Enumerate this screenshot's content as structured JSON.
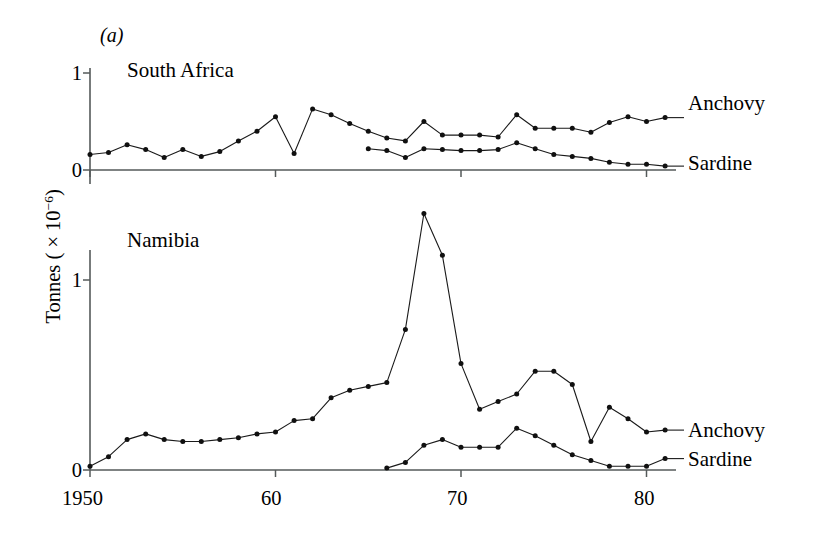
{
  "figure": {
    "panel_letter": "(a)",
    "y_axis_title_prefix": "Tonnes ( × 10",
    "y_axis_title_exponent": "−6",
    "y_axis_title_suffix": ")",
    "y_axis_title_full": "Tonnes ( × 10−6)"
  },
  "panels": [
    {
      "name": "south-africa",
      "title": "South Africa",
      "y_ticks": [
        "1",
        "0"
      ],
      "series_labels": [
        "Anchovy",
        "Sardine"
      ]
    },
    {
      "name": "namibia",
      "title": "Namibia",
      "y_ticks": [
        "1",
        "0"
      ],
      "series_labels": [
        "Anchovy",
        "Sardine"
      ]
    }
  ],
  "x_axis": {
    "tick_labels": [
      "1950",
      "60",
      "70",
      "80"
    ],
    "tick_values": [
      1950,
      1960,
      1970,
      1980
    ],
    "range": [
      1950,
      1981.5
    ]
  },
  "chart_data": [
    {
      "type": "line",
      "title": "South Africa",
      "panel": "upper",
      "xlabel": "",
      "ylabel": "Tonnes ( × 10−6)",
      "xlim": [
        1950,
        1981.5
      ],
      "ylim": [
        0,
        1.05
      ],
      "ytick_values": [
        0,
        1
      ],
      "ytick_labels": [
        "0",
        "1"
      ],
      "xtick_values": [
        1950,
        1960,
        1970,
        1980
      ],
      "xtick_labels": [
        "1950",
        "60",
        "70",
        "80"
      ],
      "grid": false,
      "legend": "right-of-plot",
      "markers": true,
      "series": [
        {
          "name": "Anchovy",
          "x": [
            1950,
            1951,
            1952,
            1953,
            1954,
            1955,
            1956,
            1957,
            1958,
            1959,
            1960,
            1961,
            1962,
            1963,
            1964,
            1965,
            1966,
            1967,
            1968,
            1969,
            1970,
            1971,
            1972,
            1973,
            1974,
            1975,
            1976,
            1977,
            1978,
            1979,
            1980,
            1981
          ],
          "values": [
            0.16,
            0.18,
            0.26,
            0.21,
            0.13,
            0.21,
            0.14,
            0.19,
            0.3,
            0.4,
            0.55,
            0.17,
            0.63,
            0.57,
            0.48,
            0.4,
            0.33,
            0.3,
            0.5,
            0.36,
            0.36,
            0.36,
            0.34,
            0.57,
            0.43,
            0.43,
            0.43,
            0.39,
            0.49,
            0.55,
            0.5,
            0.54
          ]
        },
        {
          "name": "Sardine",
          "x": [
            1965,
            1966,
            1967,
            1968,
            1969,
            1970,
            1971,
            1972,
            1973,
            1974,
            1975,
            1976,
            1977,
            1978,
            1979,
            1980,
            1981
          ],
          "values": [
            0.22,
            0.2,
            0.13,
            0.22,
            0.21,
            0.2,
            0.2,
            0.21,
            0.28,
            0.22,
            0.16,
            0.14,
            0.12,
            0.08,
            0.06,
            0.06,
            0.04
          ]
        }
      ]
    },
    {
      "type": "line",
      "title": "Namibia",
      "panel": "lower",
      "xlabel": "",
      "ylabel": "Tonnes ( × 10−6)",
      "xlim": [
        1950,
        1981.5
      ],
      "ylim": [
        0,
        1.45
      ],
      "ytick_values": [
        0,
        1
      ],
      "ytick_labels": [
        "0",
        "1"
      ],
      "xtick_values": [
        1950,
        1960,
        1970,
        1980
      ],
      "xtick_labels": [
        "1950",
        "60",
        "70",
        "80"
      ],
      "grid": false,
      "legend": "right-of-plot",
      "markers": true,
      "series": [
        {
          "name": "Anchovy",
          "x": [
            1950,
            1951,
            1952,
            1953,
            1954,
            1955,
            1956,
            1957,
            1958,
            1959,
            1960,
            1961,
            1962,
            1963,
            1964,
            1965,
            1966,
            1967,
            1968,
            1969,
            1970,
            1971,
            1972,
            1973,
            1974,
            1975,
            1976,
            1977,
            1978,
            1979,
            1980,
            1981
          ],
          "values": [
            0.02,
            0.07,
            0.16,
            0.19,
            0.16,
            0.15,
            0.15,
            0.16,
            0.17,
            0.19,
            0.2,
            0.26,
            0.27,
            0.38,
            0.42,
            0.44,
            0.46,
            0.74,
            1.35,
            1.13,
            0.56,
            0.32,
            0.36,
            0.4,
            0.52,
            0.52,
            0.45,
            0.15,
            0.33,
            0.27,
            0.2,
            0.21
          ]
        },
        {
          "name": "Sardine",
          "x": [
            1966,
            1967,
            1968,
            1969,
            1970,
            1971,
            1972,
            1973,
            1974,
            1975,
            1976,
            1977,
            1978,
            1979,
            1980,
            1981
          ],
          "values": [
            0.01,
            0.04,
            0.13,
            0.16,
            0.12,
            0.12,
            0.12,
            0.22,
            0.18,
            0.13,
            0.08,
            0.05,
            0.02,
            0.02,
            0.02,
            0.06
          ]
        }
      ]
    }
  ]
}
